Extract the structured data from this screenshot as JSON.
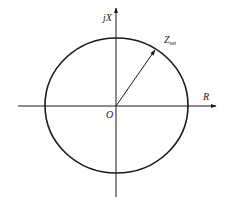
{
  "diagram": {
    "type": "impedance-plane-circle",
    "colors": {
      "stroke": "#1a1a1a",
      "background": "#ffffff"
    },
    "axes": {
      "horizontal": {
        "label": "R",
        "x1": 18,
        "x2": 216,
        "y": 106
      },
      "vertical": {
        "label": "jX",
        "y1": 8,
        "y2": 197,
        "x": 116
      }
    },
    "origin": {
      "label": "O",
      "x": 116,
      "y": 106
    },
    "circle": {
      "cx": 116.5,
      "cy": 105.5,
      "rx": 71.5,
      "ry": 67.5
    },
    "radius_vector": {
      "label_main": "Z",
      "label_sub": "set",
      "x1": 116,
      "y1": 106,
      "x2": 155,
      "y2": 50
    }
  }
}
